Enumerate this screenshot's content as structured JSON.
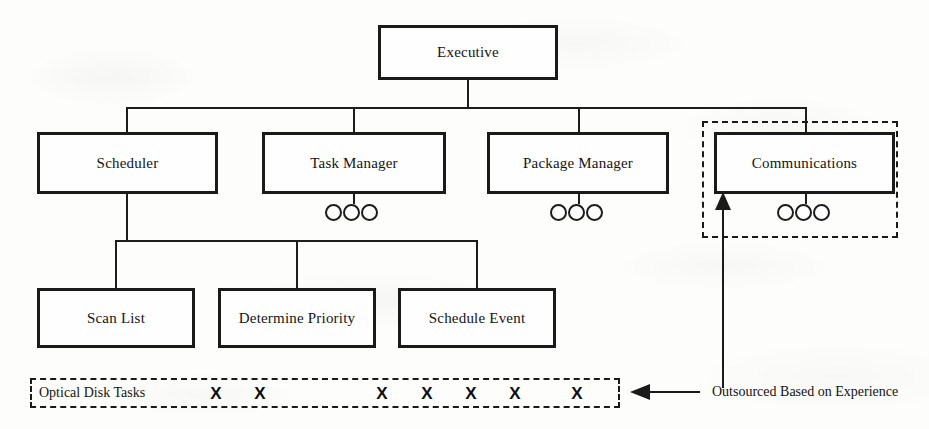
{
  "diagram": {
    "background_color": "#fdfdfc",
    "line_color": "#1a1a1a",
    "nodes": {
      "executive": {
        "label": "Executive"
      },
      "scheduler": {
        "label": "Scheduler"
      },
      "task_manager": {
        "label": "Task Manager"
      },
      "package_manager": {
        "label": "Package Manager"
      },
      "communications": {
        "label": "Communications"
      },
      "scan_list": {
        "label": "Scan List"
      },
      "determine_priority": {
        "label": "Determine Priority"
      },
      "schedule_event": {
        "label": "Schedule Event"
      }
    },
    "task_bar": {
      "label": "Optical Disk Tasks",
      "markers": [
        "X",
        "X",
        "X",
        "X",
        "X",
        "X",
        "X"
      ],
      "marker_positions": [
        214,
        258,
        380,
        425,
        469,
        513,
        575
      ]
    },
    "annotations": {
      "outsourced": "Outsourced Based on Experience"
    },
    "leaf_dot_groups": [
      {
        "owner": "task-manager",
        "count": 3
      },
      {
        "owner": "package-manager",
        "count": 3
      },
      {
        "owner": "communications",
        "count": 3
      }
    ]
  }
}
